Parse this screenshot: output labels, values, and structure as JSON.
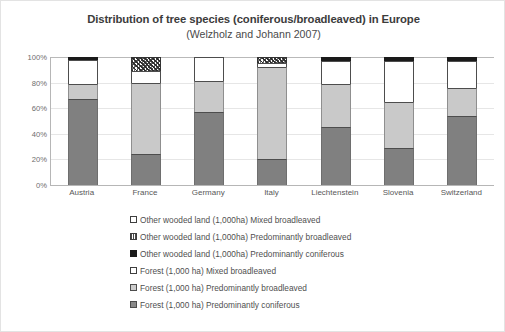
{
  "chart_data": {
    "type": "bar",
    "stacked": true,
    "normalized_percent": true,
    "title": "Distribution of tree species (coniferous/broadleaved) in Europe",
    "subtitle": "(Welzholz and Johann 2007)",
    "xlabel": "",
    "ylabel": "",
    "ylim": [
      0,
      100
    ],
    "grid": true,
    "legend_position": "bottom",
    "categories": [
      "Austria",
      "France",
      "Germany",
      "Italy",
      "Liechtenstein",
      "Slovenia",
      "Switzerland"
    ],
    "y_ticks": [
      "0%",
      "20%",
      "40%",
      "60%",
      "80%",
      "100%"
    ],
    "y_tick_values": [
      0,
      20,
      40,
      60,
      80,
      100
    ],
    "series": [
      {
        "name": "Forest (1,000 ha) Predominantly coniferous",
        "swatch": "conif",
        "values": [
          67,
          24,
          57,
          20,
          45,
          29,
          54
        ]
      },
      {
        "name": "Forest (1,000 ha) Predominantly broadleaved",
        "swatch": "broad",
        "values": [
          12,
          56,
          24,
          72,
          34,
          36,
          22
        ]
      },
      {
        "name": "Forest (1,000 ha) Mixed broadleaved",
        "swatch": "mixed",
        "values": [
          19,
          9,
          19,
          3,
          18,
          32,
          21
        ]
      },
      {
        "name": "Other wooded land (1,000ha) Predominantly coniferous",
        "swatch": "owl-conif",
        "values": [
          2,
          0,
          0,
          0,
          3,
          3,
          3
        ]
      },
      {
        "name": "Other wooded land (1,000ha) Predominantly broadleaved",
        "swatch": "owl-broad",
        "values": [
          0,
          11,
          0,
          5,
          0,
          0,
          0
        ]
      },
      {
        "name": "Other wooded land (1,000ha) Mixed broadleaved",
        "swatch": "owl-mixed",
        "values": [
          0,
          0,
          0,
          0,
          0,
          0,
          0
        ]
      }
    ],
    "legend": [
      "Other wooded land (1,000ha) Mixed broadleaved",
      "Other wooded land (1,000ha) Predominantly broadleaved",
      "Other wooded land (1,000ha) Predominantly coniferous",
      "Forest (1,000 ha) Mixed broadleaved",
      "Forest (1,000 ha) Predominantly broadleaved",
      "Forest (1,000 ha) Predominantly coniferous"
    ],
    "colors": {
      "predominantly_coniferous": "#808080",
      "predominantly_broadleaved": "#c9c9c9",
      "mixed_broadleaved": "#ffffff",
      "owl_predominantly_coniferous": "#1a1a1a",
      "grid": "#e6e6e6",
      "axis": "#b6b6b6",
      "title_text": "#3c3c3c",
      "label_text": "#585858"
    }
  }
}
